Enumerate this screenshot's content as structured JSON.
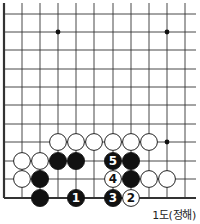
{
  "diagram": {
    "caption": "1도(정해)",
    "colors": {
      "line": "#333333",
      "black_stone": "#111111",
      "white_stone": "#ffffff",
      "label_on_black": "#ffffff",
      "label_on_white": "#111111"
    },
    "grid": {
      "columns_x": [
        4,
        22,
        40,
        58,
        76,
        94,
        113,
        131,
        149,
        167,
        185
      ],
      "rows_y": [
        14,
        32,
        50,
        69,
        87,
        105,
        124,
        142,
        161,
        179,
        198
      ],
      "left_edge": true,
      "bottom_edge": true,
      "line_extent": {
        "right": 196,
        "top": 3
      }
    },
    "star_points": [
      {
        "col": 3,
        "row": 1
      },
      {
        "col": 9,
        "row": 1
      },
      {
        "col": 9,
        "row": 7
      }
    ],
    "stones": [
      {
        "color": "white",
        "col": 3,
        "row": 7,
        "label": ""
      },
      {
        "color": "white",
        "col": 4,
        "row": 7,
        "label": ""
      },
      {
        "color": "white",
        "col": 5,
        "row": 7,
        "label": ""
      },
      {
        "color": "white",
        "col": 6,
        "row": 7,
        "label": ""
      },
      {
        "color": "white",
        "col": 7,
        "row": 7,
        "label": ""
      },
      {
        "color": "white",
        "col": 8,
        "row": 7,
        "label": ""
      },
      {
        "color": "white",
        "col": 1,
        "row": 8,
        "label": ""
      },
      {
        "color": "white",
        "col": 2,
        "row": 8,
        "label": ""
      },
      {
        "color": "black",
        "col": 3,
        "row": 8,
        "label": ""
      },
      {
        "color": "black",
        "col": 4,
        "row": 8,
        "label": ""
      },
      {
        "color": "black",
        "col": 6,
        "row": 8,
        "label": "5"
      },
      {
        "color": "black",
        "col": 7,
        "row": 8,
        "label": ""
      },
      {
        "color": "white",
        "col": 1,
        "row": 9,
        "label": ""
      },
      {
        "color": "black",
        "col": 2,
        "row": 9,
        "label": ""
      },
      {
        "color": "white",
        "col": 6,
        "row": 9,
        "label": "4"
      },
      {
        "color": "black",
        "col": 7,
        "row": 9,
        "label": ""
      },
      {
        "color": "white",
        "col": 8,
        "row": 9,
        "label": ""
      },
      {
        "color": "white",
        "col": 9,
        "row": 9,
        "label": ""
      },
      {
        "color": "black",
        "col": 2,
        "row": 10,
        "label": ""
      },
      {
        "color": "black",
        "col": 4,
        "row": 10,
        "label": "1"
      },
      {
        "color": "black",
        "col": 6,
        "row": 10,
        "label": "3"
      },
      {
        "color": "white",
        "col": 7,
        "row": 10,
        "label": "2"
      }
    ]
  }
}
